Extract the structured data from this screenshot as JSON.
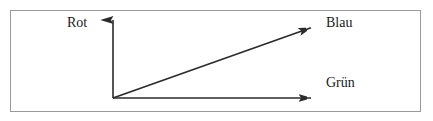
{
  "figure": {
    "type": "axis-diagram",
    "background_color": "#ffffff",
    "frame": {
      "border_color": "#9a9a9a",
      "border_width_px": 1,
      "x": 10,
      "y": 10,
      "width": 411,
      "height": 102
    },
    "line_color": "#2b2b2b",
    "origin": {
      "x": 113,
      "y": 98
    },
    "axes": [
      {
        "id": "rot",
        "label": "Rot",
        "direction": "up",
        "from": {
          "x": 113,
          "y": 98
        },
        "to": {
          "x": 113,
          "y": 18
        },
        "arrowhead": true,
        "label_position": {
          "x": 67,
          "y": 16
        }
      },
      {
        "id": "gruen",
        "label": "Grün",
        "direction": "right",
        "from": {
          "x": 113,
          "y": 98
        },
        "to": {
          "x": 313,
          "y": 98
        },
        "arrowhead": true,
        "label_position": {
          "x": 326,
          "y": 76
        }
      },
      {
        "id": "blau",
        "label": "Blau",
        "direction": "diagonal-up-right",
        "from": {
          "x": 113,
          "y": 98
        },
        "to": {
          "x": 313,
          "y": 27
        },
        "arrowhead": true,
        "label_position": {
          "x": 326,
          "y": 16
        }
      }
    ]
  },
  "labels": {
    "rot": "Rot",
    "blau": "Blau",
    "gruen": "Grün"
  }
}
